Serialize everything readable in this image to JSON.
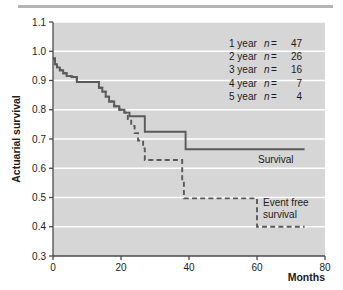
{
  "figure": {
    "background_color": "#ffffff",
    "plot_background_color": "#d6d6d6",
    "gridline_color": "#ffffff",
    "axis_color": "#4a4a4a",
    "curve_color": "#5a5a5a"
  },
  "axes": {
    "y_title": "Actuarial survival",
    "x_title": "Months",
    "y_ticks": [
      "1.1",
      "1.0",
      "0.9",
      "0.8",
      "0.7",
      "0.6",
      "0.5",
      "0.4",
      "0.3"
    ],
    "x_ticks": [
      "0",
      "20",
      "40",
      "60",
      "80"
    ]
  },
  "annotations": {
    "survival_label": "Survival",
    "event_free_label_line1": "Event free",
    "event_free_label_line2": "survival"
  },
  "risk_table": [
    {
      "year": "1 year",
      "n_symbol": "n",
      "equals": "=",
      "value": "47"
    },
    {
      "year": "2 year",
      "n_symbol": "n",
      "equals": "=",
      "value": "26"
    },
    {
      "year": "3 year",
      "n_symbol": "n",
      "equals": "=",
      "value": "16"
    },
    {
      "year": "4 year",
      "n_symbol": "n",
      "equals": "=",
      "value": "7"
    },
    {
      "year": "5 year",
      "n_symbol": "n",
      "equals": "=",
      "value": "4"
    }
  ],
  "chart_data": {
    "type": "line",
    "title": "",
    "xlabel": "Months",
    "ylabel": "Actuarial survival",
    "xlim": [
      0,
      80
    ],
    "ylim": [
      0.3,
      1.1
    ],
    "xticks": [
      0,
      20,
      40,
      60,
      80
    ],
    "yticks": [
      0.3,
      0.4,
      0.5,
      0.6,
      0.7,
      0.8,
      0.9,
      1.0,
      1.1
    ],
    "grid": "horizontal",
    "legend_position": "inside-right",
    "step_type": "post",
    "series": [
      {
        "name": "Survival",
        "style": "solid",
        "x": [
          0,
          0.6,
          1.2,
          2.0,
          3.0,
          4.0,
          5.5,
          7.0,
          7.0,
          12.5,
          13.5,
          14.5,
          15.5,
          16.5,
          18.0,
          19.5,
          21.0,
          22.5,
          24.5,
          26.5,
          27.0,
          38.5,
          39.0,
          74.0
        ],
        "y": [
          0.975,
          0.955,
          0.945,
          0.935,
          0.925,
          0.915,
          0.912,
          0.912,
          0.895,
          0.895,
          0.875,
          0.862,
          0.845,
          0.828,
          0.812,
          0.8,
          0.79,
          0.778,
          0.778,
          0.778,
          0.725,
          0.725,
          0.665,
          0.665
        ]
      },
      {
        "name": "Event free survival",
        "style": "dashed",
        "x": [
          0,
          0.6,
          1.2,
          2.0,
          3.0,
          4.0,
          5.5,
          7.0,
          7.0,
          12.5,
          13.5,
          14.5,
          15.5,
          16.5,
          18.0,
          19.5,
          21.0,
          22.0,
          23.0,
          24.0,
          25.0,
          26.5,
          27.0,
          36.5,
          37.0,
          38.0,
          38.5,
          60.0,
          60.0,
          74.0
        ],
        "y": [
          0.975,
          0.955,
          0.945,
          0.935,
          0.925,
          0.915,
          0.912,
          0.912,
          0.895,
          0.895,
          0.875,
          0.862,
          0.845,
          0.828,
          0.812,
          0.8,
          0.79,
          0.768,
          0.745,
          0.72,
          0.695,
          0.668,
          0.628,
          0.628,
          0.628,
          0.558,
          0.497,
          0.497,
          0.4,
          0.4
        ]
      }
    ],
    "annotations": [
      {
        "text": "Survival",
        "x": 63,
        "y": 0.625
      },
      {
        "text": "Event free survival",
        "x": 63,
        "y": 0.455
      }
    ]
  }
}
